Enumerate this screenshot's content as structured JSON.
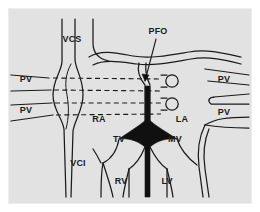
{
  "figure": {
    "background_color": "#e2e2e2",
    "border_color": "#ffffff",
    "ink_color": "#1b1b1b"
  },
  "labels": {
    "vcs": "VCS",
    "vci": "VCI",
    "pfo": "PFO",
    "ra": "RA",
    "la": "LA",
    "rv": "RV",
    "lv": "LV",
    "tv": "TV",
    "mv": "MV",
    "pv_left_upper": "PV",
    "pv_left_lower": "PV",
    "pv_right_upper": "PV",
    "pv_right_lower": "PV"
  },
  "diagram_elements": {
    "dashed_flow_lines_count": 4,
    "bubble_circles_count": 2,
    "septum_style": "solid-black-wedge",
    "pointer_from": "PFO label",
    "pointer_to": "foramen ovale flap"
  }
}
